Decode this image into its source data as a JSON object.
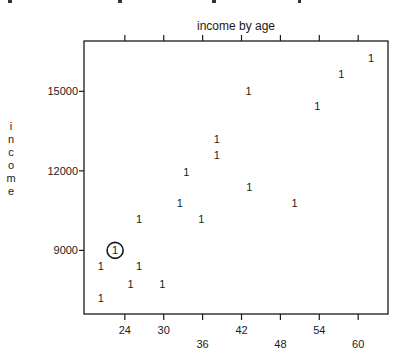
{
  "chart_data": {
    "type": "scatter",
    "title": "income by age",
    "xlabel": "",
    "ylabel": "income",
    "xlim": [
      17.7,
      64.6
    ],
    "ylim": [
      6600,
      16900
    ],
    "x_ticks_top": [
      24,
      30,
      36,
      42,
      48,
      54,
      60
    ],
    "x_tick_labels_bottom_row1": [
      "24",
      "30",
      "42",
      "54"
    ],
    "x_tick_labels_bottom_row2": [
      "36",
      "48",
      "60"
    ],
    "x_ticks_bottom": [
      24,
      30,
      36,
      42,
      48,
      54,
      60
    ],
    "y_ticks": [
      9000,
      12000,
      15000
    ],
    "y_tick_labels": [
      "9000",
      "12000",
      "15000"
    ],
    "grid": false,
    "marker": "1",
    "points": [
      {
        "x": 22.5,
        "y": 9000,
        "highlighted": true
      },
      {
        "x": 20.3,
        "y": 8400
      },
      {
        "x": 26.2,
        "y": 8400
      },
      {
        "x": 24.9,
        "y": 7750
      },
      {
        "x": 29.8,
        "y": 7750
      },
      {
        "x": 20.3,
        "y": 7200
      },
      {
        "x": 26.2,
        "y": 10200
      },
      {
        "x": 35.8,
        "y": 10200
      },
      {
        "x": 32.5,
        "y": 10800
      },
      {
        "x": 50.2,
        "y": 10800
      },
      {
        "x": 33.5,
        "y": 11950
      },
      {
        "x": 43.2,
        "y": 11400
      },
      {
        "x": 38.2,
        "y": 12600
      },
      {
        "x": 38.2,
        "y": 13200
      },
      {
        "x": 43.1,
        "y": 15000
      },
      {
        "x": 53.7,
        "y": 14450
      },
      {
        "x": 57.4,
        "y": 15650
      },
      {
        "x": 62.0,
        "y": 16250
      }
    ]
  }
}
